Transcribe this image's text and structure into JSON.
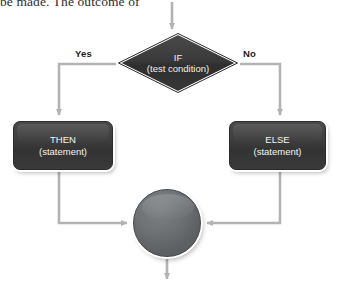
{
  "page": {
    "body_text": "be made. The outcome of",
    "background_color": "#ffffff"
  },
  "diagram": {
    "type": "flowchart",
    "colors": {
      "node_fill_dark": "#3d3d3d",
      "diamond_fill": "#333333",
      "circle_fill": "#6e7274",
      "node_text": "#f4f4f4",
      "connector": "#b3b3b3",
      "label_text": "#1c1c1c",
      "node_outline": "#ffffff"
    },
    "nodes": [
      {
        "id": "decision",
        "shape": "diamond",
        "title": "IF",
        "subtitle": "(test condition)"
      },
      {
        "id": "then",
        "shape": "rounded-rectangle",
        "title": "THEN",
        "subtitle": "(statement)"
      },
      {
        "id": "else",
        "shape": "rounded-rectangle",
        "title": "ELSE",
        "subtitle": "(statement)"
      },
      {
        "id": "merge",
        "shape": "circle",
        "title": "",
        "subtitle": ""
      }
    ],
    "edge_labels": {
      "yes": "Yes",
      "no": "No"
    },
    "edges": [
      {
        "from": "entry",
        "to": "decision",
        "label": ""
      },
      {
        "from": "decision",
        "to": "then",
        "label": "Yes"
      },
      {
        "from": "decision",
        "to": "else",
        "label": "No"
      },
      {
        "from": "then",
        "to": "merge",
        "label": ""
      },
      {
        "from": "else",
        "to": "merge",
        "label": ""
      },
      {
        "from": "merge",
        "to": "exit",
        "label": ""
      }
    ]
  }
}
